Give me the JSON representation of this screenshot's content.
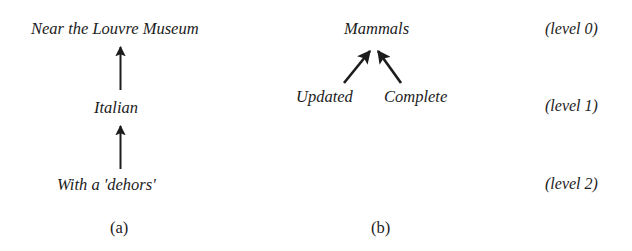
{
  "figure": {
    "background_color": "#ffffff",
    "ink_color": "#1c1c1c",
    "panels": [
      {
        "id": "a",
        "caption": "(a)",
        "nodes": [
          {
            "id": "a-top",
            "label": "Near the Louvre Museum",
            "level": 0
          },
          {
            "id": "a-mid",
            "label": "Italian",
            "level": 1
          },
          {
            "id": "a-bottom",
            "label": "With a 'dehors'",
            "level": 2
          }
        ],
        "edges": [
          {
            "from": "a-mid",
            "to": "a-top",
            "style": "arrow-up"
          },
          {
            "from": "a-bottom",
            "to": "a-mid",
            "style": "arrow-up"
          }
        ]
      },
      {
        "id": "b",
        "caption": "(b)",
        "nodes": [
          {
            "id": "b-top",
            "label": "Mammals",
            "level": 0
          },
          {
            "id": "b-left",
            "label": "Updated",
            "level": 1
          },
          {
            "id": "b-right",
            "label": "Complete",
            "level": 1
          }
        ],
        "edges": [
          {
            "from": "b-left",
            "to": "b-top",
            "style": "arrow-diagonal-right"
          },
          {
            "from": "b-right",
            "to": "b-top",
            "style": "arrow-diagonal-left"
          }
        ]
      }
    ],
    "level_labels": [
      {
        "id": "level-0",
        "text": "(level 0)"
      },
      {
        "id": "level-1",
        "text": "(level 1)"
      },
      {
        "id": "level-2",
        "text": "(level 2)"
      }
    ]
  }
}
